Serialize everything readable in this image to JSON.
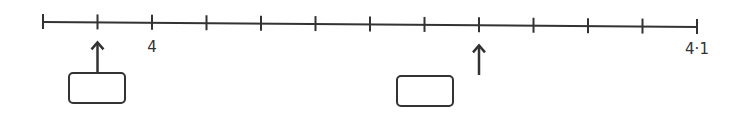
{
  "number_line": {
    "start_value": 3.98,
    "end_value": 4.1,
    "step": 0.01,
    "tick_count": 13,
    "line_color": "#333333",
    "labels": [
      {
        "tick_index": 2,
        "value": 4,
        "text": "4"
      },
      {
        "tick_index": 12,
        "value": 4.1,
        "text": "4·1"
      }
    ],
    "arrows": [
      {
        "tick_index": 1,
        "value": 3.99,
        "answer_box": {
          "content": ""
        }
      },
      {
        "tick_index": 8,
        "value": 4.06,
        "answer_box": {
          "content": ""
        }
      }
    ]
  },
  "chart_data": {
    "type": "number_line",
    "range": [
      3.98,
      4.1
    ],
    "interval": 0.01,
    "tick_labels": [
      "4",
      "4·1"
    ],
    "marked_points": [
      3.99,
      4.06
    ],
    "answer_boxes": [
      "",
      ""
    ]
  }
}
